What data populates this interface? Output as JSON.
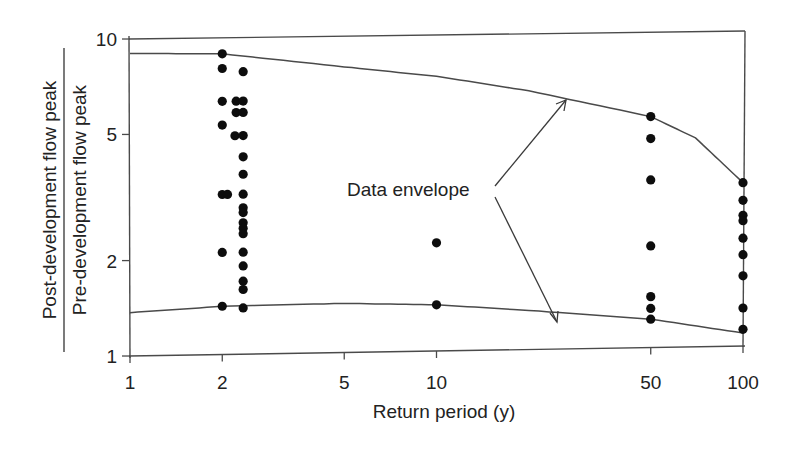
{
  "chart_data": {
    "type": "scatter",
    "title": "",
    "xlabel": "Return period (y)",
    "ylabel_numerator": "Post-development flow peak",
    "ylabel_denominator": "Pre-development flow peak",
    "xscale": "log",
    "yscale": "log",
    "xlim": [
      1,
      100
    ],
    "ylim": [
      1,
      10
    ],
    "xticks": [
      1,
      2,
      5,
      10,
      50,
      100
    ],
    "yticks": [
      1,
      2,
      5,
      10
    ],
    "grid": false,
    "legend": null,
    "annotation": {
      "text": "Data envelope",
      "arrows_to": [
        "upper envelope curve",
        "lower envelope curve"
      ]
    },
    "series": [
      {
        "name": "Observations",
        "points": [
          {
            "x": 2.0,
            "y": 8.9
          },
          {
            "x": 2.0,
            "y": 8.0
          },
          {
            "x": 2.0,
            "y": 6.3
          },
          {
            "x": 2.0,
            "y": 5.3
          },
          {
            "x": 2.0,
            "y": 3.2
          },
          {
            "x": 2.0,
            "y": 2.1
          },
          {
            "x": 2.0,
            "y": 1.42
          },
          {
            "x": 2.08,
            "y": 3.2
          },
          {
            "x": 2.22,
            "y": 6.3
          },
          {
            "x": 2.22,
            "y": 5.8
          },
          {
            "x": 2.2,
            "y": 4.9
          },
          {
            "x": 2.34,
            "y": 7.8
          },
          {
            "x": 2.34,
            "y": 6.3
          },
          {
            "x": 2.34,
            "y": 5.8
          },
          {
            "x": 2.34,
            "y": 4.9
          },
          {
            "x": 2.34,
            "y": 4.2
          },
          {
            "x": 2.34,
            "y": 3.7
          },
          {
            "x": 2.34,
            "y": 3.2
          },
          {
            "x": 2.34,
            "y": 2.9
          },
          {
            "x": 2.34,
            "y": 2.8
          },
          {
            "x": 2.34,
            "y": 2.6
          },
          {
            "x": 2.34,
            "y": 2.5
          },
          {
            "x": 2.34,
            "y": 2.4
          },
          {
            "x": 2.34,
            "y": 2.1
          },
          {
            "x": 2.34,
            "y": 1.9
          },
          {
            "x": 2.34,
            "y": 1.7
          },
          {
            "x": 2.34,
            "y": 1.6
          },
          {
            "x": 2.34,
            "y": 1.4
          },
          {
            "x": 10,
            "y": 2.2
          },
          {
            "x": 10,
            "y": 1.4
          },
          {
            "x": 50,
            "y": 5.4
          },
          {
            "x": 50,
            "y": 4.6
          },
          {
            "x": 50,
            "y": 3.4
          },
          {
            "x": 50,
            "y": 2.1
          },
          {
            "x": 50,
            "y": 1.45
          },
          {
            "x": 50,
            "y": 1.33
          },
          {
            "x": 50,
            "y": 1.23
          },
          {
            "x": 100,
            "y": 3.3
          },
          {
            "x": 100,
            "y": 2.9
          },
          {
            "x": 100,
            "y": 2.6
          },
          {
            "x": 100,
            "y": 2.5
          },
          {
            "x": 100,
            "y": 2.2
          },
          {
            "x": 100,
            "y": 1.95
          },
          {
            "x": 100,
            "y": 1.67
          },
          {
            "x": 100,
            "y": 1.32
          },
          {
            "x": 100,
            "y": 1.13
          }
        ]
      },
      {
        "name": "Upper data envelope",
        "type": "line",
        "points": [
          {
            "x": 1,
            "y": 9.0
          },
          {
            "x": 2,
            "y": 8.9
          },
          {
            "x": 5,
            "y": 8.0
          },
          {
            "x": 10,
            "y": 7.4
          },
          {
            "x": 20,
            "y": 6.6
          },
          {
            "x": 50,
            "y": 5.4
          },
          {
            "x": 70,
            "y": 4.6
          },
          {
            "x": 100,
            "y": 3.3
          }
        ]
      },
      {
        "name": "Lower data envelope",
        "type": "line",
        "points": [
          {
            "x": 1,
            "y": 1.37
          },
          {
            "x": 2,
            "y": 1.42
          },
          {
            "x": 5,
            "y": 1.43
          },
          {
            "x": 10,
            "y": 1.4
          },
          {
            "x": 20,
            "y": 1.33
          },
          {
            "x": 50,
            "y": 1.23
          },
          {
            "x": 100,
            "y": 1.1
          }
        ]
      }
    ]
  }
}
